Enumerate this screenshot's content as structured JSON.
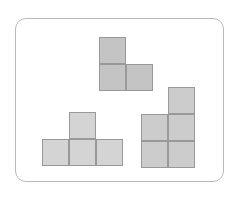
{
  "canvas": {
    "width": 240,
    "height": 200,
    "background": "#ffffff"
  },
  "frame": {
    "name": "rounded-border-frame",
    "x": 15,
    "y": 18,
    "width": 209,
    "height": 164,
    "corner_radius": 11,
    "border_color": "#b9b9b9",
    "border_width": 1,
    "fill": "#ffffff"
  },
  "grid": {
    "cell_size": 27,
    "cell_border_color": "#999999"
  },
  "shapes": [
    {
      "id": "shape-top",
      "name": "L-tromino",
      "label": "L-tromino",
      "fill": "#c4c4c4",
      "stroke": "#999999",
      "origin": {
        "x": 99,
        "y": 37
      },
      "cells": [
        {
          "col": 0,
          "row": 0
        },
        {
          "col": 0,
          "row": 1
        },
        {
          "col": 1,
          "row": 1
        }
      ],
      "cell_count": 3
    },
    {
      "id": "shape-bottom-left",
      "name": "T-tetromino",
      "label": "T-tetromino",
      "fill": "#d4d4d4",
      "stroke": "#999999",
      "origin": {
        "x": 42,
        "y": 112
      },
      "cells": [
        {
          "col": 1,
          "row": 0
        },
        {
          "col": 0,
          "row": 1
        },
        {
          "col": 1,
          "row": 1
        },
        {
          "col": 2,
          "row": 1
        }
      ],
      "cell_count": 4
    },
    {
      "id": "shape-bottom-right",
      "name": "P-pentomino",
      "label": "P-pentomino",
      "fill": "#cccccc",
      "stroke": "#999999",
      "origin": {
        "x": 141,
        "y": 87
      },
      "cells": [
        {
          "col": 1,
          "row": 0
        },
        {
          "col": 0,
          "row": 1
        },
        {
          "col": 1,
          "row": 1
        },
        {
          "col": 0,
          "row": 2
        },
        {
          "col": 1,
          "row": 2
        }
      ],
      "cell_count": 5
    }
  ]
}
